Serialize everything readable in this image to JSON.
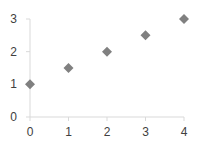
{
  "chart_data": {
    "type": "scatter",
    "title": "",
    "xlabel": "",
    "ylabel": "",
    "xlim": [
      0,
      4
    ],
    "ylim": [
      0,
      3
    ],
    "x_ticks": [
      "0",
      "1",
      "2",
      "3",
      "4"
    ],
    "y_ticks": [
      "0",
      "1",
      "2",
      "3"
    ],
    "grid": false,
    "legend": "none",
    "marker": "diamond",
    "marker_color": "#808080",
    "series": [
      {
        "name": "Series 1",
        "x": [
          0,
          1,
          2,
          3,
          4
        ],
        "y": [
          1,
          1.5,
          2,
          2.5,
          3
        ]
      }
    ]
  }
}
